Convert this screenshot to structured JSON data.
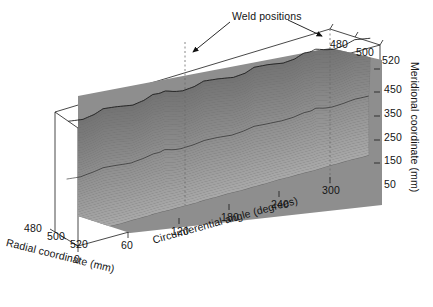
{
  "figure": {
    "type": "3d-surface-plot",
    "background": "#ffffff",
    "line_color": "#1a1a1a",
    "mesh_color": "#8a8a8a",
    "mesh_dark": "#3a3a3a"
  },
  "annotations": {
    "weld_label": "Weld positions",
    "weld_positions_deg": [
      120,
      300
    ]
  },
  "axes": {
    "x": {
      "label": "Circumferential angle (degrees)",
      "ticks": [
        "0",
        "60",
        "120",
        "180",
        "240",
        "300"
      ],
      "values": [
        0,
        60,
        120,
        180,
        240,
        300
      ],
      "range": [
        0,
        360
      ]
    },
    "y": {
      "label": "Radial coordinate (mm)",
      "ticks": [
        "480",
        "500",
        "520"
      ],
      "values": [
        480,
        500,
        520
      ],
      "range": [
        480,
        520
      ]
    },
    "z": {
      "label": "Meridional coordinate (mm)",
      "ticks": [
        "50",
        "150",
        "250",
        "350",
        "450"
      ],
      "values": [
        50,
        150,
        250,
        350,
        450
      ],
      "range": [
        0,
        500
      ]
    },
    "depth_top_ticks": [
      "480",
      "500",
      "520"
    ]
  },
  "chart_data": {
    "type": "surface",
    "title": "",
    "subtitle": "",
    "xlabel": "Circumferential angle (degrees)",
    "ylabel": "Radial coordinate (mm)",
    "zlabel": "Meridional coordinate (mm)",
    "xlim": [
      0,
      360
    ],
    "ylim": [
      480,
      520
    ],
    "zlim": [
      0,
      500
    ],
    "xticks": [
      0,
      60,
      120,
      180,
      240,
      300
    ],
    "yticks": [
      480,
      500,
      520
    ],
    "zticks": [
      50,
      150,
      250,
      350,
      450
    ],
    "grid": false,
    "legend": "none",
    "annotations": [
      {
        "text": "Weld positions",
        "points_to_deg": [
          120,
          300
        ]
      }
    ],
    "x": [
      0,
      15,
      30,
      45,
      60,
      75,
      90,
      105,
      120,
      135,
      150,
      165,
      180,
      195,
      210,
      225,
      240,
      255,
      270,
      285,
      300,
      315,
      330,
      345,
      360
    ],
    "series": [
      {
        "name": "meridional 450 mm (top edge)",
        "meridional": 450,
        "values": [
          503,
          507,
          504,
          498,
          501,
          506,
          503,
          497,
          500,
          505,
          503,
          498,
          501,
          506,
          504,
          498,
          500,
          505,
          503,
          497,
          499,
          505,
          503,
          498,
          503
        ]
      },
      {
        "name": "meridional 350 mm",
        "meridional": 350,
        "values": [
          502,
          506,
          503,
          498,
          500,
          505,
          502,
          497,
          499,
          504,
          502,
          498,
          500,
          505,
          503,
          498,
          500,
          504,
          502,
          497,
          499,
          504,
          502,
          498,
          502
        ]
      },
      {
        "name": "meridional 250 mm (transition band)",
        "meridional": 250,
        "values": [
          500,
          503,
          501,
          498,
          500,
          503,
          501,
          498,
          499,
          502,
          501,
          499,
          500,
          503,
          501,
          498,
          500,
          502,
          501,
          498,
          499,
          502,
          501,
          499,
          500
        ]
      },
      {
        "name": "meridional 150 mm",
        "meridional": 150,
        "values": [
          500,
          501,
          500,
          499,
          500,
          501,
          500,
          499,
          500,
          501,
          500,
          499,
          500,
          501,
          500,
          499,
          500,
          501,
          500,
          499,
          500,
          501,
          500,
          499,
          500
        ]
      },
      {
        "name": "meridional 50 mm (base)",
        "meridional": 50,
        "values": [
          500,
          500,
          500,
          500,
          500,
          500,
          500,
          500,
          500,
          500,
          500,
          500,
          500,
          500,
          500,
          500,
          500,
          500,
          500,
          500,
          500,
          500,
          500,
          500,
          500
        ]
      }
    ]
  }
}
